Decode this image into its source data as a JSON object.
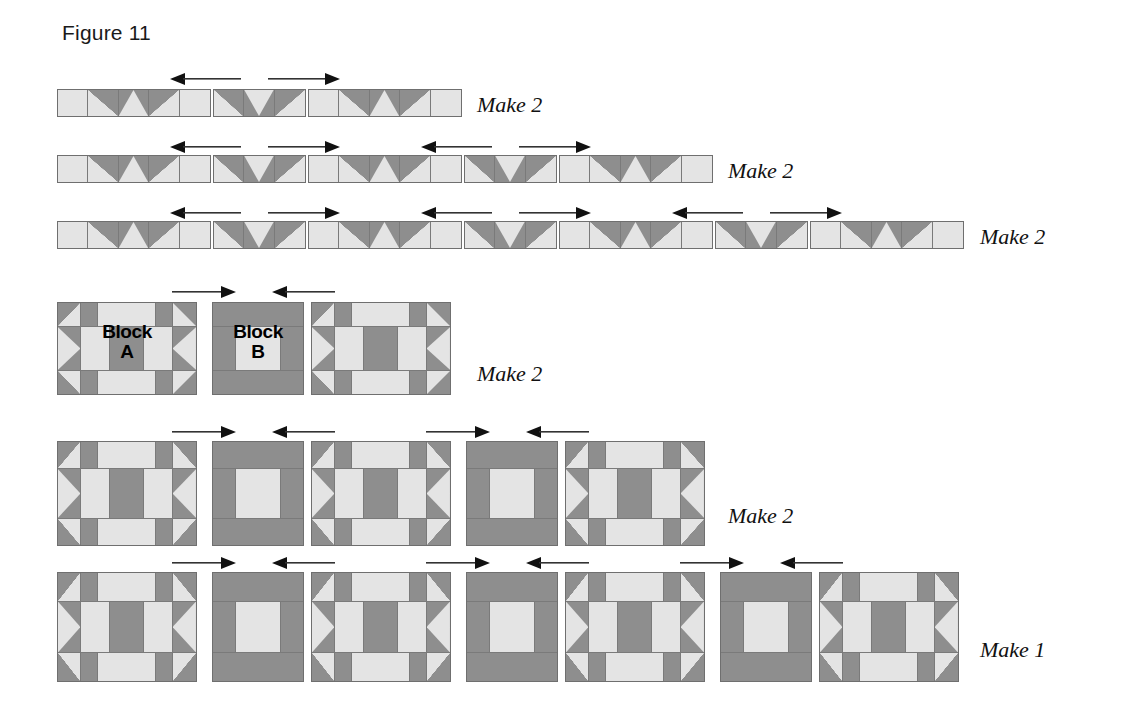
{
  "figure": {
    "caption": "Figure 11",
    "type": "quilt-block-assembly-diagram"
  },
  "colors": {
    "dark_fabric": "#8e8e8e",
    "light_fabric": "#e4e4e4",
    "seam_line": "#7a7a7a",
    "outline": "#6f6f6f",
    "arrow": "#111111",
    "text": "#111111",
    "background": "#ffffff"
  },
  "labels": {
    "block_a": "Block\nA",
    "block_a_line1": "Block",
    "block_a_line2": "A",
    "block_b_line1": "Block",
    "block_b_line2": "B",
    "make_2": "Make 2",
    "make_1": "Make 1"
  },
  "rows": [
    {
      "id": "sashing-row-1",
      "kind": "pieced-strip-row",
      "make_label": "Make 2",
      "segment_count": 3,
      "arrows": [
        {
          "direction": "left",
          "label": "press-left"
        },
        {
          "direction": "right",
          "label": "press-right"
        }
      ],
      "segments": [
        {
          "type": "strip-A",
          "units": [
            "light",
            "hst-dark-light-lowerleft",
            "goose-up",
            "hst-dark-light-lowerright",
            "light"
          ]
        },
        {
          "type": "strip-B",
          "units": [
            "hst-dark-light-lowerleft",
            "goose-down",
            "hst-dark-light-lowerright"
          ]
        },
        {
          "type": "strip-A",
          "units": [
            "light",
            "hst-dark-light-lowerleft",
            "goose-up",
            "hst-dark-light-lowerright",
            "light"
          ]
        }
      ]
    },
    {
      "id": "sashing-row-2",
      "kind": "pieced-strip-row",
      "make_label": "Make 2",
      "segment_count": 5,
      "arrows": [
        {
          "direction": "left",
          "label": "press-left"
        },
        {
          "direction": "right",
          "label": "press-right"
        },
        {
          "direction": "left",
          "label": "press-left"
        },
        {
          "direction": "right",
          "label": "press-right"
        }
      ],
      "segments": [
        {
          "type": "strip-A",
          "units": [
            "light",
            "hst-dark-light-lowerleft",
            "goose-up",
            "hst-dark-light-lowerright",
            "light"
          ]
        },
        {
          "type": "strip-B",
          "units": [
            "hst-dark-light-lowerleft",
            "goose-down",
            "hst-dark-light-lowerright"
          ]
        },
        {
          "type": "strip-A",
          "units": [
            "light",
            "hst-dark-light-lowerleft",
            "goose-up",
            "hst-dark-light-lowerright",
            "light"
          ]
        },
        {
          "type": "strip-B",
          "units": [
            "hst-dark-light-lowerleft",
            "goose-down",
            "hst-dark-light-lowerright"
          ]
        },
        {
          "type": "strip-A",
          "units": [
            "light",
            "hst-dark-light-lowerleft",
            "goose-up",
            "hst-dark-light-lowerright",
            "light"
          ]
        }
      ]
    },
    {
      "id": "sashing-row-3",
      "kind": "pieced-strip-row",
      "make_label": "Make 2",
      "segment_count": 7,
      "arrows": [
        {
          "direction": "left",
          "label": "press-left"
        },
        {
          "direction": "right",
          "label": "press-right"
        },
        {
          "direction": "left",
          "label": "press-left"
        },
        {
          "direction": "right",
          "label": "press-right"
        },
        {
          "direction": "left",
          "label": "press-left"
        },
        {
          "direction": "right",
          "label": "press-right"
        }
      ],
      "segments": [
        {
          "type": "strip-A",
          "units": [
            "light",
            "hst-dark-light-lowerleft",
            "goose-up",
            "hst-dark-light-lowerright",
            "light"
          ]
        },
        {
          "type": "strip-B",
          "units": [
            "hst-dark-light-lowerleft",
            "goose-down",
            "hst-dark-light-lowerright"
          ]
        },
        {
          "type": "strip-A",
          "units": [
            "light",
            "hst-dark-light-lowerleft",
            "goose-up",
            "hst-dark-light-lowerright",
            "light"
          ]
        },
        {
          "type": "strip-B",
          "units": [
            "hst-dark-light-lowerleft",
            "goose-down",
            "hst-dark-light-lowerright"
          ]
        },
        {
          "type": "strip-A",
          "units": [
            "light",
            "hst-dark-light-lowerleft",
            "goose-up",
            "hst-dark-light-lowerright",
            "light"
          ]
        },
        {
          "type": "strip-B",
          "units": [
            "hst-dark-light-lowerleft",
            "goose-down",
            "hst-dark-light-lowerright"
          ]
        },
        {
          "type": "strip-A",
          "units": [
            "light",
            "hst-dark-light-lowerleft",
            "goose-up",
            "hst-dark-light-lowerright",
            "light"
          ]
        }
      ]
    },
    {
      "id": "block-row-1",
      "kind": "block-row",
      "make_label": "Make 2",
      "block_count": 3,
      "arrows": [
        {
          "direction": "right",
          "label": "press-right"
        },
        {
          "direction": "left",
          "label": "press-left"
        }
      ],
      "blocks": [
        {
          "type": "A",
          "text_line1": "Block",
          "text_line2": "A"
        },
        {
          "type": "B",
          "text_line1": "Block",
          "text_line2": "B"
        },
        {
          "type": "A",
          "text_line1": "",
          "text_line2": ""
        }
      ]
    },
    {
      "id": "block-row-2",
      "kind": "block-row",
      "make_label": "Make 2",
      "block_count": 5,
      "arrows": [
        {
          "direction": "right",
          "label": "press-right"
        },
        {
          "direction": "left",
          "label": "press-left"
        },
        {
          "direction": "right",
          "label": "press-right"
        },
        {
          "direction": "left",
          "label": "press-left"
        }
      ],
      "blocks": [
        {
          "type": "A"
        },
        {
          "type": "B"
        },
        {
          "type": "A"
        },
        {
          "type": "B"
        },
        {
          "type": "A"
        }
      ]
    },
    {
      "id": "block-row-3",
      "kind": "block-row",
      "make_label": "Make 1",
      "block_count": 7,
      "arrows": [
        {
          "direction": "right",
          "label": "press-right"
        },
        {
          "direction": "left",
          "label": "press-left"
        },
        {
          "direction": "right",
          "label": "press-right"
        },
        {
          "direction": "left",
          "label": "press-left"
        },
        {
          "direction": "right",
          "label": "press-right"
        },
        {
          "direction": "left",
          "label": "press-left"
        }
      ],
      "blocks": [
        {
          "type": "A"
        },
        {
          "type": "B"
        },
        {
          "type": "A"
        },
        {
          "type": "B"
        },
        {
          "type": "A"
        },
        {
          "type": "B"
        },
        {
          "type": "A"
        }
      ]
    }
  ]
}
